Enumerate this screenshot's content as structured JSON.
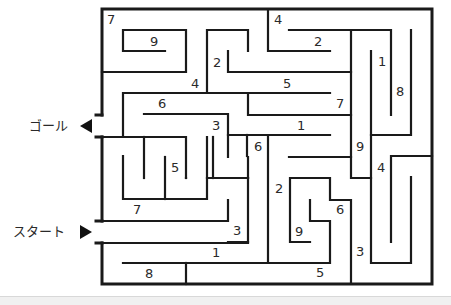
{
  "goal": {
    "label": "ゴール",
    "arrow": "left-triangle"
  },
  "start": {
    "label": "スタート",
    "arrow": "right-triangle"
  },
  "numbers": [
    {
      "v": "7",
      "x": 107,
      "y": 13
    },
    {
      "v": "9",
      "x": 150,
      "y": 35
    },
    {
      "v": "4",
      "x": 274,
      "y": 13
    },
    {
      "v": "2",
      "x": 314,
      "y": 35
    },
    {
      "v": "2",
      "x": 213,
      "y": 56
    },
    {
      "v": "1",
      "x": 378,
      "y": 55
    },
    {
      "v": "8",
      "x": 396,
      "y": 85
    },
    {
      "v": "4",
      "x": 191,
      "y": 77
    },
    {
      "v": "5",
      "x": 283,
      "y": 77
    },
    {
      "v": "6",
      "x": 158,
      "y": 97
    },
    {
      "v": "7",
      "x": 336,
      "y": 97
    },
    {
      "v": "3",
      "x": 212,
      "y": 119
    },
    {
      "v": "1",
      "x": 297,
      "y": 119
    },
    {
      "v": "6",
      "x": 254,
      "y": 140
    },
    {
      "v": "9",
      "x": 356,
      "y": 140
    },
    {
      "v": "4",
      "x": 377,
      "y": 161
    },
    {
      "v": "5",
      "x": 171,
      "y": 161
    },
    {
      "v": "2",
      "x": 275,
      "y": 182
    },
    {
      "v": "6",
      "x": 336,
      "y": 203
    },
    {
      "v": "7",
      "x": 133,
      "y": 203
    },
    {
      "v": "3",
      "x": 233,
      "y": 224
    },
    {
      "v": "9",
      "x": 295,
      "y": 225
    },
    {
      "v": "3",
      "x": 356,
      "y": 245
    },
    {
      "v": "1",
      "x": 212,
      "y": 246
    },
    {
      "v": "5",
      "x": 316,
      "y": 266
    },
    {
      "v": "8",
      "x": 145,
      "y": 267
    }
  ],
  "colors": {
    "wall": "#1a1a1a",
    "text": "#2a2a2a",
    "background": "#ffffff"
  }
}
